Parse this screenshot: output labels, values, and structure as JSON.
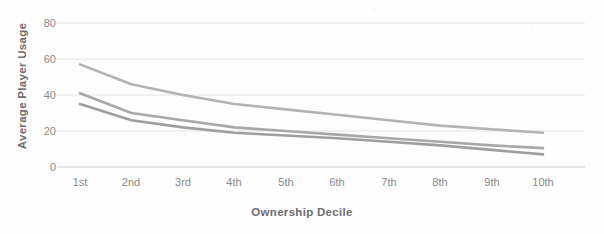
{
  "chart_data": {
    "type": "line",
    "title": "",
    "xlabel": "Ownership Decile",
    "ylabel": "Average Player Usage",
    "categories": [
      "1st",
      "2nd",
      "3rd",
      "4th",
      "5th",
      "6th",
      "7th",
      "8th",
      "9th",
      "10th"
    ],
    "yticks": [
      0,
      20,
      40,
      60,
      80
    ],
    "ylim": [
      0,
      80
    ],
    "grid": true,
    "legend": "none",
    "series": [
      {
        "name": "series-1-upper",
        "color": "#b3b3b3",
        "values": [
          57,
          46,
          40,
          35,
          32,
          29,
          26,
          23,
          21,
          19
        ]
      },
      {
        "name": "series-2-middle",
        "color": "#a8a8a8",
        "values": [
          41,
          30,
          26,
          22,
          20,
          18,
          16,
          14,
          12,
          10.5
        ]
      },
      {
        "name": "series-3-lower",
        "color": "#9e9e9e",
        "values": [
          35,
          26,
          22,
          19,
          17.5,
          16,
          14,
          12,
          9.5,
          7
        ]
      }
    ]
  },
  "axis": {
    "y_title": "Average Player Usage",
    "x_title": "Ownership Decile",
    "y_tick_labels": [
      "80",
      "60",
      "40",
      "20",
      "0"
    ],
    "x_tick_labels": [
      "1st",
      "2nd",
      "3rd",
      "4th",
      "5th",
      "6th",
      "7th",
      "8th",
      "9th",
      "10th"
    ]
  },
  "colors": {
    "gridline": "#e2e2e2",
    "axis_line": "#d0d0d0",
    "tick_text": "#8a8a8a",
    "title_text": "#6e6e6e",
    "background": "#fdfdfd"
  }
}
